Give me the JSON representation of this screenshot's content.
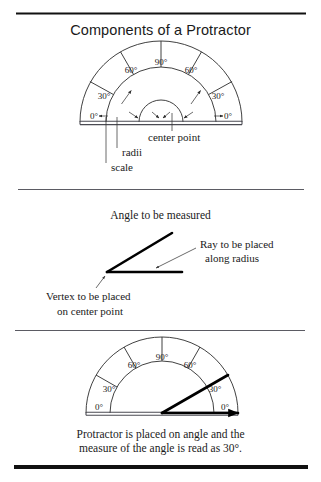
{
  "document": {
    "title": "Components of a Protractor",
    "background_color": "#ffffff",
    "ink_color": "#1a1a1a"
  },
  "rules": {
    "top_rule": "top-horizontal-rule",
    "divider_one": "panel-divider-1",
    "divider_two": "panel-divider-2",
    "bottom_rule": "bottom-horizontal-rule"
  },
  "panel_one": {
    "title": "Components of a Protractor",
    "protractor": {
      "scale_labels_left": [
        "0°",
        "30°",
        "60°"
      ],
      "scale_label_top": "90°",
      "scale_labels_right": [
        "60°",
        "30°",
        "0°"
      ],
      "tick_angles": [
        0,
        30,
        60,
        90,
        120,
        150,
        180
      ]
    },
    "callouts": [
      {
        "label": "center point",
        "target": "center-point"
      },
      {
        "label": "radii",
        "target": "radii"
      },
      {
        "label": "scale",
        "target": "scale"
      }
    ]
  },
  "panel_two": {
    "heading": "Angle to be measured",
    "callouts": [
      {
        "label_line_1": "Ray to be placed",
        "label_line_2": "along radius"
      },
      {
        "label_line_1": "Vertex to be placed",
        "label_line_2": "on center point"
      }
    ]
  },
  "panel_three": {
    "protractor": {
      "scale_labels_left": [
        "0°",
        "30°",
        "60°"
      ],
      "scale_label_top": "90°",
      "scale_labels_right": [
        "60°",
        "30°",
        "0°"
      ]
    },
    "measured_angle": "30°",
    "caption_line_1": "Protractor is placed on angle and the",
    "caption_line_2": "measure of the angle is read as 30°."
  }
}
